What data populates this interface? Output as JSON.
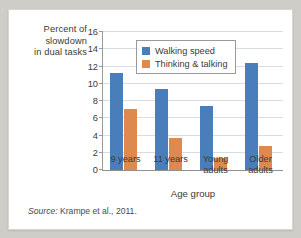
{
  "figure": {
    "source_prefix": "Source:",
    "source_text": "Krampe et al., 2011."
  },
  "chart_data": {
    "type": "bar",
    "title": "",
    "categories": [
      "9 years",
      "11 years",
      "Young\nadults",
      "Older\nadults"
    ],
    "series": [
      {
        "name": "Walking speed",
        "color": "#4a7ebb",
        "values": [
          11.2,
          9.4,
          7.4,
          12.4
        ]
      },
      {
        "name": "Thinking & talking",
        "color": "#de8a4f",
        "values": [
          7.1,
          3.7,
          1.4,
          2.8
        ]
      }
    ],
    "xlabel": "Age group",
    "ylabel": "Percent of slowdown in dual tasks",
    "ylabel_lines": [
      "Percent of",
      "slowdown",
      "in dual tasks"
    ],
    "ylim": [
      0,
      16
    ],
    "ytick_step": 2,
    "yticks": [
      0,
      2,
      4,
      6,
      8,
      10,
      12,
      14,
      16
    ],
    "ytick_labels": [
      "0",
      "2",
      "4",
      "6",
      "8",
      "10",
      "12",
      "14",
      "16"
    ],
    "grid": true,
    "legend_position": "top-center"
  }
}
